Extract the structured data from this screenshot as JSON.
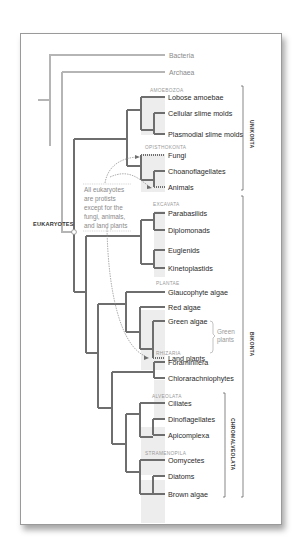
{
  "diagram": {
    "type": "phylogenetic-tree",
    "outgroups": [
      {
        "label": "Bacteria"
      },
      {
        "label": "Archaea"
      }
    ],
    "root_label": "EUKARYOTES",
    "annotation": {
      "lines": [
        "All eukaryotes",
        "are protists",
        "except for the",
        "fungi, animals,",
        "and land plants"
      ]
    },
    "groups": [
      {
        "name": "AMOEBOZOA",
        "taxa": [
          "Lobose amoebae",
          "Cellular slime molds",
          "Plasmodial slime molds"
        ]
      },
      {
        "name": "OPISTHOKONTA",
        "taxa": [
          "Fungi",
          "Choanoflagellates",
          "Animals"
        ]
      },
      {
        "name": "EXCAVATA",
        "taxa": [
          "Parabasilids",
          "Diplomonads",
          "Euglenids",
          "Kinetoplastids"
        ]
      },
      {
        "name": "PLANTAE",
        "taxa": [
          "Glaucophyte algae",
          "Red algae",
          "Green algae",
          "Land plants"
        ]
      },
      {
        "name": "RHIZARIA",
        "taxa": [
          "Foraminifera",
          "Chlorarachniophytes"
        ]
      },
      {
        "name": "ALVEOLATA",
        "taxa": [
          "Ciliates",
          "Dinoflagellates",
          "Apicomplexa"
        ]
      },
      {
        "name": "STRAMENOPILA",
        "taxa": [
          "Oomycetes",
          "Diatoms",
          "Brown algae"
        ]
      }
    ],
    "brackets": {
      "green_plants": [
        "Green",
        "plants"
      ],
      "unikonta": "UNIKONTA",
      "bikonta": "BIKONTA",
      "chromalveolata": "CHROMALVEOLATA"
    },
    "colors": {
      "outgroup_line": "#b5b5b5",
      "branch_line": "#6e6e6e",
      "clade_shade": "#ededed",
      "text": "#2a2a2a",
      "muted_text": "#999999"
    }
  }
}
